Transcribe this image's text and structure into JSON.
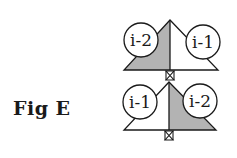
{
  "figure": {
    "label": "Fig E",
    "colors": {
      "stroke": "#1a1a1a",
      "shade": "#b3b3b3",
      "background": "#ffffff"
    },
    "panels": [
      {
        "position": "top",
        "shaded_side": "left",
        "circles": [
          {
            "label": "i-2",
            "side": "left"
          },
          {
            "label": "i-1",
            "side": "right"
          }
        ]
      },
      {
        "position": "bottom",
        "shaded_side": "right",
        "circles": [
          {
            "label": "i-1",
            "side": "left"
          },
          {
            "label": "i-2",
            "side": "right"
          }
        ]
      }
    ]
  }
}
